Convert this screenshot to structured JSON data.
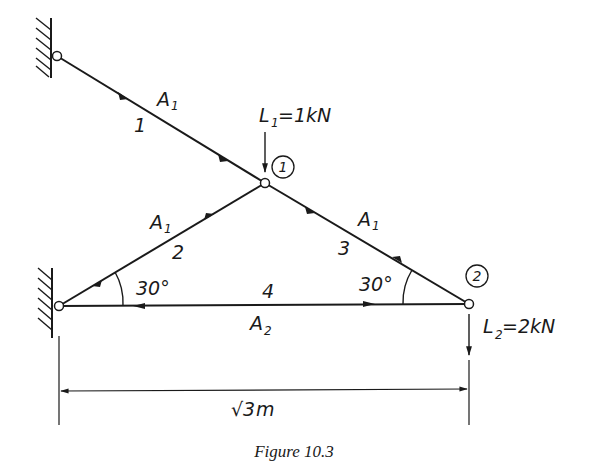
{
  "figure": {
    "caption": "Figure 10.3",
    "colors": {
      "ink": "#1a1a1a",
      "background": "#ffffff"
    }
  },
  "nodes": {
    "node1": {
      "label": "1"
    },
    "node2": {
      "label": "2"
    }
  },
  "members": [
    {
      "id": "1",
      "area": "A",
      "area_sub": "1"
    },
    {
      "id": "2",
      "area": "A",
      "area_sub": "1"
    },
    {
      "id": "3",
      "area": "A",
      "area_sub": "1"
    },
    {
      "id": "4",
      "area": "A",
      "area_sub": "2"
    }
  ],
  "loads": {
    "L1": {
      "symbol": "L",
      "sub": "1",
      "value": "=1kN"
    },
    "L2": {
      "symbol": "L",
      "sub": "2",
      "value": "=2kN"
    }
  },
  "angles": {
    "left": "30°",
    "right": "30°"
  },
  "dimension": {
    "radical": "√3",
    "unit": "m"
  }
}
